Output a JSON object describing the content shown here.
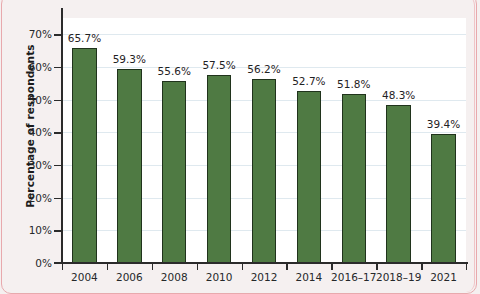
{
  "chart_data": {
    "type": "bar",
    "title": "",
    "subtitle": "",
    "xlabel": "",
    "ylabel": "Percentage of respondents",
    "categories": [
      "2004",
      "2006",
      "2008",
      "2010",
      "2012",
      "2014",
      "2016–17",
      "2018–19",
      "2021"
    ],
    "values": [
      65.7,
      59.3,
      55.6,
      57.5,
      56.2,
      52.7,
      51.8,
      48.3,
      39.4
    ],
    "value_labels": [
      "65.7%",
      "59.3%",
      "55.6%",
      "57.5%",
      "56.2%",
      "52.7%",
      "51.8%",
      "48.3%",
      "39.4%"
    ],
    "ylim": [
      0,
      75
    ],
    "yticks": [
      0,
      10,
      20,
      30,
      40,
      50,
      60,
      70
    ],
    "ytick_labels": [
      "0%",
      "10%",
      "20%",
      "30%",
      "40%",
      "50%",
      "60%",
      "70%"
    ],
    "grid": true,
    "grid_axis": "y",
    "legend": false,
    "legend_position": "none",
    "series": [
      {
        "name": "Percentage of respondents",
        "values": [
          65.7,
          59.3,
          55.6,
          57.5,
          56.2,
          52.7,
          51.8,
          48.3,
          39.4
        ]
      }
    ],
    "colors": {
      "bar_fill": "#4f7a43",
      "bar_edge": "#20331c",
      "gridline": "#dfe9ef",
      "axis": "#2b2b2b",
      "plot_background": "#ffffff",
      "figure_background": "#f5f0f0",
      "page_frame": "#e8a9ad",
      "text": "#25282a"
    }
  }
}
